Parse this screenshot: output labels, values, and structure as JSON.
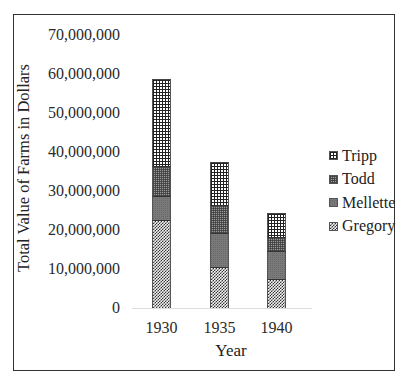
{
  "chart_data": {
    "type": "bar",
    "stacked": true,
    "title": "",
    "xlabel": "Year",
    "ylabel": "Total Value of Farms in Dollars",
    "categories": [
      "1930",
      "1935",
      "1940"
    ],
    "series": [
      {
        "name": "Gregory",
        "values": [
          22400000,
          10300000,
          7300000
        ]
      },
      {
        "name": "Mellette",
        "values": [
          6000000,
          8800000,
          7100000
        ]
      },
      {
        "name": "Todd",
        "values": [
          7800000,
          7100000,
          3500000
        ]
      },
      {
        "name": "Tripp",
        "values": [
          22400000,
          11300000,
          6500000
        ]
      }
    ],
    "totals": [
      58600000,
      37500000,
      24400000
    ],
    "ylim": [
      0,
      70000000
    ],
    "yticks": [
      "0",
      "10,000,000",
      "20,000,000",
      "30,000,000",
      "40,000,000",
      "50,000,000",
      "60,000,000",
      "70,000,000"
    ],
    "grid": false,
    "legend_position": "right",
    "legend_order": [
      "Tripp",
      "Todd",
      "Mellette",
      "Gregory"
    ]
  },
  "axes": {
    "y_label": "Total Value of Farms in Dollars",
    "x_label": "Year",
    "y_ticks": [
      "70,000,000",
      "60,000,000",
      "50,000,000",
      "40,000,000",
      "30,000,000",
      "20,000,000",
      "10,000,000",
      "0"
    ],
    "x_ticks": [
      "1930",
      "1935",
      "1940"
    ]
  },
  "legend": {
    "items": [
      {
        "label": "Tripp",
        "pattern": "p-tripp"
      },
      {
        "label": "Todd",
        "pattern": "p-todd"
      },
      {
        "label": "Mellette",
        "pattern": "p-mellette"
      },
      {
        "label": "Gregory",
        "pattern": "p-gregory"
      }
    ]
  }
}
